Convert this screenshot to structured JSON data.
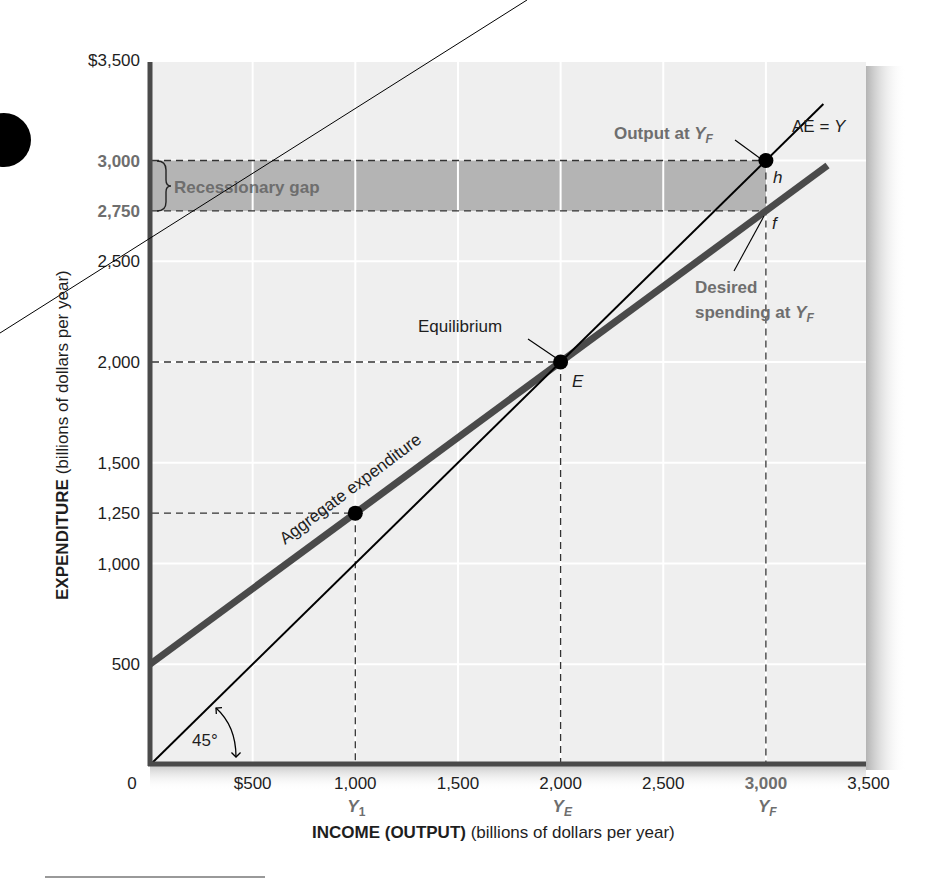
{
  "chart_data": {
    "type": "line",
    "title": "",
    "xlabel": "INCOME (OUTPUT)",
    "xlabel_unit": "(billions of dollars per year)",
    "ylabel": "EXPENDITURE",
    "ylabel_unit": "(billions of dollars per year)",
    "xlim": [
      0,
      3500
    ],
    "ylim": [
      0,
      3500
    ],
    "grid": true,
    "x_ticks": [
      {
        "value": 0,
        "label": "0"
      },
      {
        "value": 500,
        "label": "$500"
      },
      {
        "value": 1000,
        "label": "1,000",
        "sub": "Y",
        "sub_index": "1"
      },
      {
        "value": 1500,
        "label": "1,500"
      },
      {
        "value": 2000,
        "label": "2,000",
        "sub": "Y",
        "sub_index": "E"
      },
      {
        "value": 2500,
        "label": "2,500"
      },
      {
        "value": 3000,
        "label": "3,000",
        "sub": "Y",
        "sub_index": "F",
        "highlight": true
      },
      {
        "value": 3500,
        "label": "3,500"
      }
    ],
    "y_ticks": [
      {
        "value": 500,
        "label": "500"
      },
      {
        "value": 1000,
        "label": "1,000"
      },
      {
        "value": 1250,
        "label": "1,250"
      },
      {
        "value": 1500,
        "label": "1,500"
      },
      {
        "value": 2000,
        "label": "2,000"
      },
      {
        "value": 2500,
        "label": "2,500"
      },
      {
        "value": 2750,
        "label": "2,750",
        "highlight": true
      },
      {
        "value": 3000,
        "label": "3,000",
        "highlight": true
      },
      {
        "value": 3500,
        "label": "$3,500"
      }
    ],
    "series": [
      {
        "name": "Aggregate expenditure",
        "equation": "AE = 500 + 0.75Y",
        "x": [
          0,
          1000,
          2000,
          3000,
          3300
        ],
        "values": [
          500,
          1250,
          2000,
          2750,
          2975
        ],
        "style": "thick",
        "color": "#4a4a4a"
      },
      {
        "name": "AE = Y",
        "equation": "45-degree line",
        "x": [
          0,
          1000,
          2000,
          3000,
          3280
        ],
        "values": [
          0,
          1000,
          2000,
          3000,
          3280
        ],
        "style": "thin",
        "color": "#000000"
      }
    ],
    "points": [
      {
        "id": "Y1-point",
        "x": 1000,
        "y": 1250
      },
      {
        "id": "E",
        "label": "E",
        "x": 2000,
        "y": 2000,
        "annotation": "Equilibrium"
      },
      {
        "id": "h",
        "label": "h",
        "x": 3000,
        "y": 3000,
        "annotation": "Output at Y_F"
      },
      {
        "id": "f",
        "label": "f",
        "x": 3000,
        "y": 2750,
        "annotation": "Desired spending at Y_F"
      }
    ],
    "shaded_regions": [
      {
        "name": "Recessionary gap",
        "x": [
          0,
          3000
        ],
        "y": [
          2750,
          3000
        ],
        "color": "#b4b4b4"
      }
    ],
    "annotations": {
      "ae_line_label": "Aggregate expenditure",
      "forty_five_label": "AE = Y",
      "equilibrium": "Equilibrium",
      "E": "E",
      "output_at": "Output at ",
      "desired_1": "Desired",
      "desired_2": "spending at ",
      "h": "h",
      "f": "f",
      "Y": "Y",
      "F": "F",
      "angle": "45°",
      "recessionary_gap": "Recessionary gap"
    },
    "colors": {
      "background_panel": "#efefef",
      "grid": "#ffffff",
      "axis": "#4a4a4a",
      "ae_line": "#4a4a4a",
      "line45": "#000000",
      "gap_fill": "#b4b4b4",
      "highlight_text": "#6e6e6e",
      "text": "#1e1e1e"
    }
  }
}
